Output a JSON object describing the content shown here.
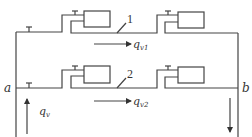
{
  "diagram": {
    "type": "parallel pipe network",
    "colors": {
      "line": "#444444",
      "background": "#ffffff",
      "text": "#333333"
    },
    "nodes": {
      "a": {
        "label": "a"
      },
      "b": {
        "label": "b"
      }
    },
    "branches": [
      {
        "id": "1",
        "label": "1",
        "flow_label": "q",
        "flow_sub": "v1",
        "units": 2,
        "valves": 3
      },
      {
        "id": "2",
        "label": "2",
        "flow_label": "q",
        "flow_sub": "v2",
        "units": 2,
        "valves": 3
      }
    ],
    "inflow": {
      "label": "q",
      "sub": "v",
      "direction": "up"
    },
    "outflow": {
      "direction": "down"
    }
  }
}
